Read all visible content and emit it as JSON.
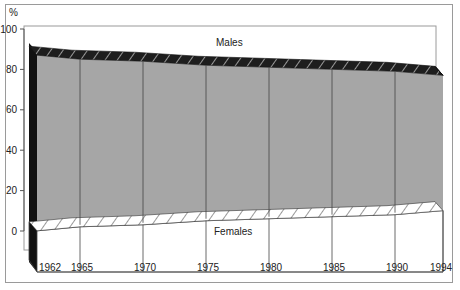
{
  "chart_data": {
    "type": "area",
    "subtype": "stacked-100-percent-3d",
    "title": "",
    "xlabel": "",
    "ylabel": "%",
    "ylim": [
      0,
      100
    ],
    "yticks": [
      0,
      20,
      40,
      60,
      80,
      100
    ],
    "x": [
      1962,
      1965,
      1970,
      1975,
      1980,
      1985,
      1990,
      1994
    ],
    "xtick_labels": [
      "1962",
      "1965",
      "1970",
      "1975",
      "1980",
      "1985",
      "1990",
      "1994"
    ],
    "series": [
      {
        "name": "Males",
        "values": [
          92,
          90,
          89,
          87,
          86,
          85,
          84,
          82
        ]
      },
      {
        "name": "Females",
        "values": [
          8,
          10,
          11,
          13,
          14,
          15,
          16,
          18
        ]
      }
    ],
    "grid": false,
    "legend": "inline-labels",
    "colors": {
      "males_face": "#a6a6a6",
      "males_top": "#1e1e1e",
      "females_face": "#ffffff",
      "frame": "#9a9a9a"
    }
  },
  "labels": {
    "y_unit": "%",
    "males": "Males",
    "females": "Females",
    "y_ticks": [
      "100",
      "80",
      "60",
      "40",
      "20",
      "0"
    ],
    "x_ticks": [
      "1962",
      "1965",
      "1970",
      "1975",
      "1980",
      "1985",
      "1990",
      "1994"
    ]
  }
}
